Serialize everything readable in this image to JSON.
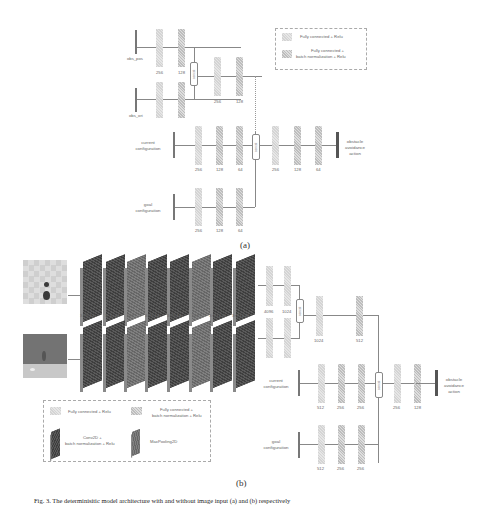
{
  "figure": {
    "part_a": {
      "label": "(a)",
      "legend": {
        "fc_relu": "Fully connected + Relu",
        "fc_bn_relu_line1": "Fully connected +",
        "fc_bn_relu_line2": "batch normalization + Relu"
      },
      "inputs": {
        "obs_pos": "obs_pos",
        "obs_ori": "obs_ori",
        "current_line1": "current",
        "current_line2": "configuration",
        "goal_line1": "goal",
        "goal_line2": "configuration"
      },
      "branch_obs_pos_units": [
        "256",
        "128"
      ],
      "branch_obs_ori_units": [
        "256",
        "128"
      ],
      "merged_obs_units": [
        "256",
        "128"
      ],
      "current_units": [
        "256",
        "128",
        "64"
      ],
      "goal_units": [
        "256",
        "128",
        "64"
      ],
      "head_units": [
        "256",
        "128",
        "64"
      ],
      "concat_label": "concat",
      "output_line1": "obstacle",
      "output_line2": "avoidance",
      "output_line3": "action"
    },
    "part_b": {
      "label": "(b)",
      "conv_layers": [
        "3×3×32",
        "3×3×32",
        "2×2",
        "3×3×64",
        "3×3×64",
        "2×2",
        "3×3×128",
        "3×3×128"
      ],
      "image_branch_units": [
        "4096",
        "1024"
      ],
      "merged_image_units": [
        "1024",
        "512"
      ],
      "current_units": [
        "512",
        "256",
        "256"
      ],
      "goal_units": [
        "512",
        "256",
        "256"
      ],
      "head_units": [
        "256",
        "128"
      ],
      "inputs": {
        "current_line1": "current",
        "current_line2": "configuration",
        "goal_line1": "goal",
        "goal_line2": "configuration"
      },
      "concat_label": "concat",
      "output_line1": "obstacle",
      "output_line2": "avoidance",
      "output_line3": "action",
      "legend": {
        "fc_relu": "Fully connected + Relu",
        "fc_bn_relu_line1": "Fully connected +",
        "fc_bn_relu_line2": "batch normalization + Relu",
        "conv_line1": "Conv2D +",
        "conv_line2": "batch normalization + Relu",
        "maxpool": "MaxPooling2D"
      }
    },
    "caption": "Fig. 3. The determinisitic model architecture with and without image input (a) and (b) respectively"
  }
}
